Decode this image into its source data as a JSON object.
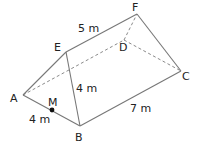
{
  "diagram": {
    "type": "triangular-prism",
    "vertices": {
      "A": {
        "label": "A",
        "x": 23,
        "y": 95
      },
      "B": {
        "label": "B",
        "x": 80,
        "y": 126
      },
      "C": {
        "label": "C",
        "x": 181,
        "y": 71
      },
      "D": {
        "label": "D",
        "x": 124,
        "y": 40
      },
      "E": {
        "label": "E",
        "x": 66,
        "y": 52
      },
      "F": {
        "label": "F",
        "x": 137,
        "y": 14
      }
    },
    "point_m": {
      "label": "M",
      "x": 52,
      "y": 110
    },
    "measurements": {
      "ef": "5 m",
      "eb": "4 m",
      "am": "4 m",
      "bc": "7 m"
    },
    "colors": {
      "edge": "#777777",
      "hidden_edge": "#8a8a8a",
      "label": "#222222",
      "point": "#111111"
    }
  }
}
